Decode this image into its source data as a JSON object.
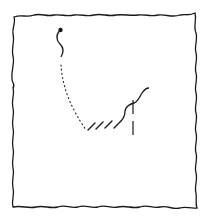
{
  "diagram": {
    "type": "hand-drawn line sketch",
    "stroke_color": "#1a1a1a",
    "background_color": "#ffffff",
    "frame": {
      "style": "wavy border",
      "bounds": [
        13,
        15,
        196,
        208
      ]
    },
    "elements": [
      {
        "id": "start-dot",
        "kind": "filled dot",
        "at": [
          60,
          30
        ]
      },
      {
        "id": "squiggle-top",
        "kind": "wavy line",
        "from": [
          60,
          30
        ],
        "to": [
          62,
          57
        ]
      },
      {
        "id": "dotted-path",
        "kind": "dotted line",
        "from": [
          61,
          64
        ],
        "to": [
          86,
          130
        ]
      },
      {
        "id": "hatched-segment",
        "kind": "hatch marks",
        "count": 4,
        "from": [
          88,
          130
        ],
        "to": [
          122,
          118
        ]
      },
      {
        "id": "wavy-curve",
        "kind": "wavy line",
        "from": [
          122,
          118
        ],
        "to": [
          149,
          88
        ]
      },
      {
        "id": "vertical-dashed",
        "kind": "dashed line",
        "from": [
          133,
          100
        ],
        "to": [
          133,
          140
        ]
      }
    ]
  }
}
